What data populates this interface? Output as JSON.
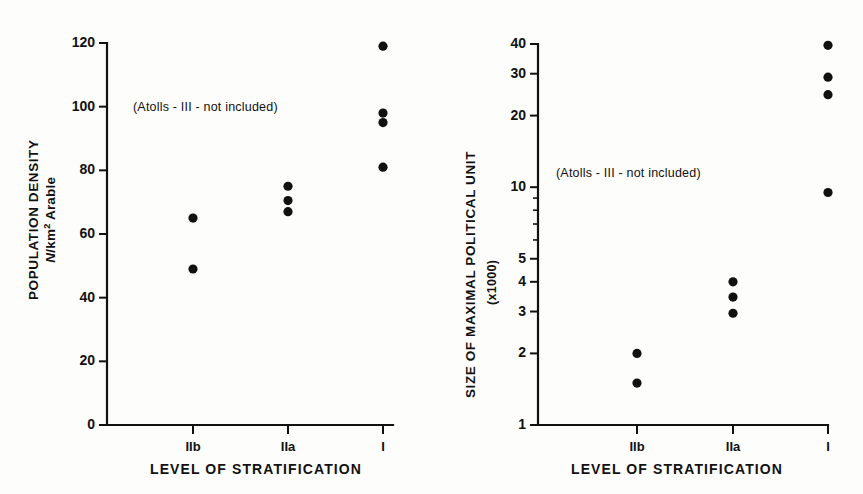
{
  "figure": {
    "background": "#fdfdfb",
    "ink_color": "#111111"
  },
  "panels": [
    {
      "id": "population-density",
      "note": "(Atolls - III - not  included)",
      "y_axis": {
        "title_line1": "POPULATION DENSITY",
        "title_line2_prefix": "N",
        "title_line2_suffix": "/km",
        "title_line2_exponent": "2",
        "title_line2_tail": " Arable",
        "scale": "linear",
        "min": 0,
        "max": 120,
        "ticks": [
          0,
          20,
          40,
          60,
          80,
          100,
          120
        ],
        "tick_labels": [
          "0",
          "20",
          "40",
          "60",
          "80",
          "100",
          "120"
        ]
      },
      "x_axis": {
        "title": "LEVEL OF STRATIFICATION",
        "categories": [
          "IIb",
          "IIa",
          "I"
        ]
      },
      "series": [
        {
          "category": "IIb",
          "values": [
            65.0,
            49.0
          ]
        },
        {
          "category": "IIa",
          "values": [
            75.0,
            70.5,
            67.0
          ]
        },
        {
          "category": "I",
          "values": [
            119.0,
            98.0,
            95.0,
            81.0
          ]
        }
      ]
    },
    {
      "id": "size-of-maximal-political-unit",
      "note": "(Atolls - III - not included)",
      "y_axis": {
        "title_line1": "SIZE OF MAXIMAL POLITICAL UNIT",
        "title_line2": "(x1000)",
        "scale": "log",
        "min": 1,
        "max": 40,
        "ticks": [
          1,
          2,
          3,
          4,
          5,
          10,
          20,
          30,
          40
        ],
        "tick_labels": [
          "1",
          "2",
          "3",
          "4",
          "5",
          "10",
          "20",
          "30",
          "40"
        ],
        "minor_ticks": [
          6,
          7,
          8,
          9
        ]
      },
      "x_axis": {
        "title": "LEVEL OF STRATIFICATION",
        "categories": [
          "IIb",
          "IIa",
          "I"
        ]
      },
      "series": [
        {
          "category": "IIb",
          "values": [
            2.0,
            1.5
          ]
        },
        {
          "category": "IIa",
          "values": [
            4.0,
            3.45,
            2.95
          ]
        },
        {
          "category": "I",
          "values": [
            39.5,
            29.0,
            24.5,
            9.5
          ]
        }
      ]
    }
  ],
  "chart_data": [
    {
      "type": "scatter",
      "title": "Population density by level of stratification",
      "xlabel": "LEVEL OF STRATIFICATION",
      "ylabel": "POPULATION DENSITY  N/km2 Arable",
      "categories": [
        "IIb",
        "IIa",
        "I"
      ],
      "yscale": "linear",
      "ylim": [
        0,
        120
      ],
      "yticks": [
        0,
        20,
        40,
        60,
        80,
        100,
        120
      ],
      "grid": false,
      "legend": "none",
      "annotation": "(Atolls - III - not  included)",
      "points": [
        {
          "x": "IIb",
          "y": 65.0
        },
        {
          "x": "IIb",
          "y": 49.0
        },
        {
          "x": "IIa",
          "y": 75.0
        },
        {
          "x": "IIa",
          "y": 70.5
        },
        {
          "x": "IIa",
          "y": 67.0
        },
        {
          "x": "I",
          "y": 119.0
        },
        {
          "x": "I",
          "y": 98.0
        },
        {
          "x": "I",
          "y": 95.0
        },
        {
          "x": "I",
          "y": 81.0
        }
      ]
    },
    {
      "type": "scatter",
      "title": "Size of maximal political unit by level of stratification",
      "xlabel": "LEVEL OF STRATIFICATION",
      "ylabel": "SIZE OF MAXIMAL POLITICAL UNIT (x1000)",
      "categories": [
        "IIb",
        "IIa",
        "I"
      ],
      "yscale": "log",
      "ylim": [
        1,
        40
      ],
      "yticks": [
        1,
        2,
        3,
        4,
        5,
        10,
        20,
        30,
        40
      ],
      "minor_yticks": [
        6,
        7,
        8,
        9
      ],
      "grid": false,
      "legend": "none",
      "annotation": "(Atolls - III - not included)",
      "points": [
        {
          "x": "IIb",
          "y": 2.0
        },
        {
          "x": "IIb",
          "y": 1.5
        },
        {
          "x": "IIa",
          "y": 4.0
        },
        {
          "x": "IIa",
          "y": 3.45
        },
        {
          "x": "IIa",
          "y": 2.95
        },
        {
          "x": "I",
          "y": 39.5
        },
        {
          "x": "I",
          "y": 29.0
        },
        {
          "x": "I",
          "y": 24.5
        },
        {
          "x": "I",
          "y": 9.5
        }
      ]
    }
  ]
}
